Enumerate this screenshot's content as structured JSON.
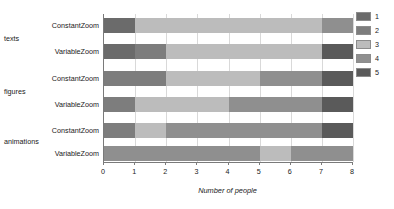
{
  "chart_data": {
    "type": "bar",
    "orientation": "horizontal",
    "stacked": true,
    "title": "",
    "xlabel": "Number of people",
    "ylabel": "",
    "xlim": [
      0,
      8
    ],
    "xticks": [
      "0",
      "1",
      "2",
      "3",
      "4",
      "5",
      "6",
      "7",
      "8"
    ],
    "grid": true,
    "legend_position": "right",
    "legend_title": "",
    "series": [
      {
        "name": "1",
        "color": "#6b6b6b",
        "values": [
          1,
          1,
          0,
          0,
          0,
          0
        ]
      },
      {
        "name": "2",
        "color": "#7d7d7d",
        "values": [
          0,
          1,
          2,
          1,
          1,
          0
        ]
      },
      {
        "name": "3",
        "color": "#bcbcbc",
        "values": [
          6,
          5,
          3,
          3,
          1,
          0
        ]
      },
      {
        "name": "4",
        "color": "#8f8f8f",
        "values": [
          1,
          0,
          2,
          3,
          5,
          8
        ]
      },
      {
        "name": "5",
        "color": "#5a5a5a",
        "values": [
          0,
          1,
          1,
          1,
          1,
          0
        ]
      }
    ],
    "categories": [
      "ConstantZoom",
      "VariableZoom",
      "ConstantZoom",
      "VariableZoom",
      "ConstantZoom",
      "VariableZoom"
    ],
    "groups": [
      {
        "label": "texts",
        "rows": [
          0,
          1
        ]
      },
      {
        "label": "figures",
        "rows": [
          2,
          3
        ]
      },
      {
        "label": "animations",
        "rows": [
          4,
          5
        ]
      }
    ],
    "bars": [
      {
        "group": "texts",
        "category": "ConstantZoom",
        "segments": [
          {
            "series": "1",
            "start": 0,
            "end": 1,
            "value": 1,
            "color": "#6b6b6b"
          },
          {
            "series": "3",
            "start": 1,
            "end": 7,
            "value": 6,
            "color": "#bcbcbc"
          },
          {
            "series": "4",
            "start": 7,
            "end": 8,
            "value": 1,
            "color": "#8f8f8f"
          }
        ]
      },
      {
        "group": "texts",
        "category": "VariableZoom",
        "segments": [
          {
            "series": "1",
            "start": 0,
            "end": 1,
            "value": 1,
            "color": "#6b6b6b"
          },
          {
            "series": "2",
            "start": 1,
            "end": 2,
            "value": 1,
            "color": "#7d7d7d"
          },
          {
            "series": "3",
            "start": 2,
            "end": 7,
            "value": 5,
            "color": "#bcbcbc"
          },
          {
            "series": "5",
            "start": 7,
            "end": 8,
            "value": 1,
            "color": "#5a5a5a"
          }
        ]
      },
      {
        "group": "figures",
        "category": "ConstantZoom",
        "segments": [
          {
            "series": "2",
            "start": 0,
            "end": 2,
            "value": 2,
            "color": "#7d7d7d"
          },
          {
            "series": "3",
            "start": 2,
            "end": 5,
            "value": 3,
            "color": "#bcbcbc"
          },
          {
            "series": "4",
            "start": 5,
            "end": 7,
            "value": 2,
            "color": "#8f8f8f"
          },
          {
            "series": "5",
            "start": 7,
            "end": 8,
            "value": 1,
            "color": "#5a5a5a"
          }
        ]
      },
      {
        "group": "figures",
        "category": "VariableZoom",
        "segments": [
          {
            "series": "2",
            "start": 0,
            "end": 1,
            "value": 1,
            "color": "#7d7d7d"
          },
          {
            "series": "3",
            "start": 1,
            "end": 4,
            "value": 3,
            "color": "#bcbcbc"
          },
          {
            "series": "4",
            "start": 4,
            "end": 7,
            "value": 3,
            "color": "#8f8f8f"
          },
          {
            "series": "5",
            "start": 7,
            "end": 8,
            "value": 1,
            "color": "#5a5a5a"
          }
        ]
      },
      {
        "group": "animations",
        "category": "ConstantZoom",
        "segments": [
          {
            "series": "2",
            "start": 0,
            "end": 1,
            "value": 1,
            "color": "#7d7d7d"
          },
          {
            "series": "3",
            "start": 1,
            "end": 2,
            "value": 1,
            "color": "#bcbcbc"
          },
          {
            "series": "4",
            "start": 2,
            "end": 7,
            "value": 5,
            "color": "#8f8f8f"
          },
          {
            "series": "5",
            "start": 7,
            "end": 8,
            "value": 1,
            "color": "#5a5a5a"
          }
        ]
      },
      {
        "group": "animations",
        "category": "VariableZoom",
        "segments": [
          {
            "series": "4",
            "start": 0,
            "end": 5,
            "value": 5,
            "color": "#8f8f8f"
          },
          {
            "series": "3",
            "start": 5,
            "end": 6,
            "value": 1,
            "color": "#bcbcbc"
          },
          {
            "series": "4",
            "start": 6,
            "end": 8,
            "value": 2,
            "color": "#8f8f8f"
          }
        ]
      }
    ],
    "legend": [
      {
        "label": "1",
        "color": "#6b6b6b"
      },
      {
        "label": "2",
        "color": "#7d7d7d"
      },
      {
        "label": "3",
        "color": "#bcbcbc"
      },
      {
        "label": "4",
        "color": "#8f8f8f"
      },
      {
        "label": "5",
        "color": "#5a5a5a"
      }
    ]
  }
}
